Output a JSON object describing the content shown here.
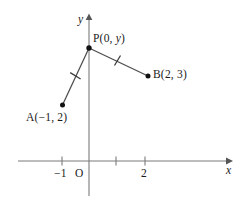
{
  "figure": {
    "type": "coordinate-geometry-diagram",
    "axes": {
      "x_label": "x",
      "y_label": "y",
      "origin_label": "O",
      "x_ticks": [
        {
          "value": -1,
          "label": "−1"
        },
        {
          "value": 1,
          "label": ""
        },
        {
          "value": 2,
          "label": "2"
        }
      ],
      "y_ticks": []
    },
    "points": [
      {
        "id": "A",
        "label": "A(−1, 2)",
        "x": -1,
        "y": 2
      },
      {
        "id": "P",
        "label": "P(0, y)",
        "x": 0,
        "y": null
      },
      {
        "id": "B",
        "label": "B(2, 3)",
        "x": 2,
        "y": 3
      }
    ],
    "segments": [
      {
        "id": "PA",
        "from": "P",
        "to": "A",
        "congruence_marks": 1
      },
      {
        "id": "PB",
        "from": "P",
        "to": "B",
        "congruence_marks": 1
      }
    ],
    "colors": {
      "line": "#5a5a5a",
      "axis": "#7a7a7a",
      "point": "#111111",
      "text": "#1a1a1a"
    }
  }
}
